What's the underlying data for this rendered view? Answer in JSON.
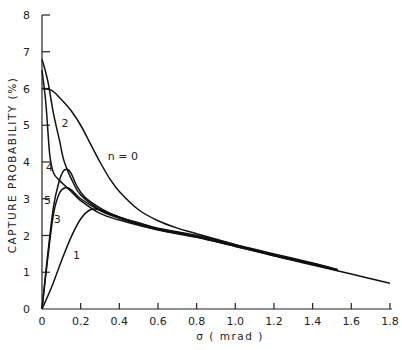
{
  "chart_data": {
    "type": "line",
    "title": "",
    "xlabel": "σ (mrad)",
    "ylabel": "CAPTURE PROBABILITY (%)",
    "xlim": [
      0,
      1.8
    ],
    "ylim": [
      0,
      8
    ],
    "grid": false,
    "legend": "inline curve labels",
    "x_ticks": [
      "0",
      "0.2",
      "0.4",
      "0.6",
      "0.8",
      "1.0",
      "1.2",
      "1.4",
      "1.6",
      "1.8"
    ],
    "y_ticks": [
      "0",
      "1",
      "2",
      "3",
      "4",
      "5",
      "6",
      "7",
      "8"
    ],
    "series": [
      {
        "name": "n = 0",
        "label_pos": [
          0.33,
          4.05
        ],
        "points": [
          [
            0,
            6.0
          ],
          [
            0.05,
            5.95
          ],
          [
            0.1,
            5.7
          ],
          [
            0.15,
            5.4
          ],
          [
            0.2,
            5.0
          ],
          [
            0.25,
            4.5
          ],
          [
            0.3,
            4.0
          ],
          [
            0.35,
            3.55
          ],
          [
            0.4,
            3.2
          ],
          [
            0.5,
            2.7
          ],
          [
            0.6,
            2.4
          ],
          [
            0.7,
            2.2
          ],
          [
            0.8,
            2.05
          ],
          [
            1.0,
            1.75
          ],
          [
            1.2,
            1.45
          ],
          [
            1.4,
            1.2
          ],
          [
            1.6,
            0.95
          ],
          [
            1.8,
            0.7
          ]
        ]
      },
      {
        "name": "2",
        "label_pos": [
          0.09,
          4.95
        ],
        "points": [
          [
            0,
            6.8
          ],
          [
            0.03,
            6.2
          ],
          [
            0.06,
            5.3
          ],
          [
            0.09,
            4.6
          ],
          [
            0.11,
            4.1
          ],
          [
            0.13,
            3.8
          ],
          [
            0.16,
            3.45
          ],
          [
            0.2,
            3.1
          ],
          [
            0.3,
            2.7
          ],
          [
            0.4,
            2.5
          ],
          [
            0.5,
            2.35
          ],
          [
            0.6,
            2.2
          ],
          [
            0.8,
            2.0
          ],
          [
            1.0,
            1.75
          ],
          [
            1.2,
            1.5
          ],
          [
            1.4,
            1.25
          ],
          [
            1.53,
            1.07
          ]
        ]
      },
      {
        "name": "4",
        "label_pos": [
          0.01,
          3.75
        ],
        "points": [
          [
            0,
            6.5
          ],
          [
            0.02,
            5.6
          ],
          [
            0.04,
            4.2
          ],
          [
            0.06,
            3.7
          ],
          [
            0.09,
            3.5
          ],
          [
            0.12,
            3.35
          ],
          [
            0.16,
            3.15
          ],
          [
            0.2,
            2.95
          ],
          [
            0.3,
            2.6
          ],
          [
            0.4,
            2.42
          ],
          [
            0.6,
            2.15
          ],
          [
            0.8,
            1.95
          ],
          [
            1.0,
            1.7
          ],
          [
            1.2,
            1.45
          ],
          [
            1.4,
            1.22
          ],
          [
            1.53,
            1.05
          ]
        ]
      },
      {
        "name": "3",
        "label_pos": [
          0.05,
          2.35
        ],
        "points": [
          [
            0,
            0
          ],
          [
            0.03,
            1.5
          ],
          [
            0.06,
            2.8
          ],
          [
            0.09,
            3.5
          ],
          [
            0.11,
            3.75
          ],
          [
            0.13,
            3.8
          ],
          [
            0.15,
            3.7
          ],
          [
            0.18,
            3.35
          ],
          [
            0.22,
            3.05
          ],
          [
            0.3,
            2.75
          ],
          [
            0.4,
            2.5
          ],
          [
            0.6,
            2.18
          ],
          [
            0.8,
            1.98
          ],
          [
            1.0,
            1.72
          ],
          [
            1.2,
            1.47
          ],
          [
            1.4,
            1.23
          ],
          [
            1.53,
            1.06
          ]
        ]
      },
      {
        "name": "5",
        "label_pos": [
          0.0,
          2.85
        ],
        "points": [
          [
            0,
            0
          ],
          [
            0.03,
            1.4
          ],
          [
            0.06,
            2.6
          ],
          [
            0.09,
            3.15
          ],
          [
            0.12,
            3.3
          ],
          [
            0.15,
            3.25
          ],
          [
            0.2,
            3.0
          ],
          [
            0.3,
            2.68
          ],
          [
            0.4,
            2.47
          ],
          [
            0.6,
            2.16
          ],
          [
            0.8,
            1.96
          ],
          [
            1.0,
            1.71
          ],
          [
            1.2,
            1.46
          ],
          [
            1.4,
            1.22
          ],
          [
            1.53,
            1.05
          ]
        ]
      },
      {
        "name": "1",
        "label_pos": [
          0.15,
          1.35
        ],
        "points": [
          [
            0,
            0
          ],
          [
            0.05,
            0.6
          ],
          [
            0.1,
            1.3
          ],
          [
            0.15,
            1.95
          ],
          [
            0.2,
            2.45
          ],
          [
            0.25,
            2.7
          ],
          [
            0.3,
            2.7
          ],
          [
            0.35,
            2.6
          ],
          [
            0.4,
            2.5
          ],
          [
            0.5,
            2.32
          ],
          [
            0.6,
            2.18
          ],
          [
            0.8,
            1.98
          ],
          [
            1.0,
            1.73
          ],
          [
            1.2,
            1.48
          ],
          [
            1.4,
            1.24
          ],
          [
            1.53,
            1.07
          ]
        ]
      }
    ]
  },
  "axes": {
    "x_title": "σ  ( mrad )",
    "y_title": "CAPTURE  PROBABILITY  (%)"
  }
}
